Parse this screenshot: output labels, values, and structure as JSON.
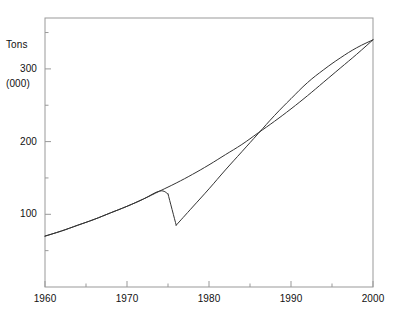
{
  "chart_data": {
    "type": "line",
    "title": "",
    "subtitle": "",
    "ylabel_line1": "Tons",
    "ylabel_line2": "(000)",
    "ylabel": "Tons (000)",
    "xlabel": "",
    "xlim": [
      1960,
      2000
    ],
    "ylim": [
      0,
      370
    ],
    "grid": false,
    "legend": "none",
    "annotations": [],
    "x_major_ticks": [
      1960,
      1970,
      1980,
      1990,
      2000
    ],
    "x_major_tick_labels": [
      "1960",
      "1970",
      "1980",
      "1990",
      "2000"
    ],
    "x_minor_ticks": [
      1965,
      1975,
      1985,
      1995
    ],
    "y_major_ticks": [
      100,
      200,
      300
    ],
    "y_major_tick_labels": [
      "100",
      "200",
      "300"
    ],
    "y_minor_ticks": [
      50,
      150,
      250,
      350
    ],
    "line_color": "#333333",
    "axis_color": "#999999",
    "series": [
      {
        "name": "trend",
        "x": [
          1960,
          1962,
          1964,
          1966,
          1968,
          1970,
          1972,
          1974,
          1976,
          1978,
          1980,
          1982,
          1984,
          1986,
          1988,
          1990,
          1992,
          1994,
          1996,
          1998,
          2000
        ],
        "values": [
          70,
          77,
          85,
          93,
          102,
          111,
          121,
          132,
          143,
          155,
          168,
          182,
          196,
          212,
          228,
          245,
          263,
          282,
          301,
          320,
          340
        ]
      },
      {
        "name": "disrupted",
        "x": [
          1960,
          1962,
          1964,
          1966,
          1968,
          1970,
          1972,
          1974,
          1975,
          1976,
          1978,
          1980,
          1982,
          1984,
          1986,
          1988,
          1990,
          1992,
          1994,
          1996,
          1998,
          2000
        ],
        "values": [
          70,
          77,
          85,
          93,
          102,
          111,
          121,
          132,
          128,
          85,
          110,
          135,
          161,
          186,
          211,
          236,
          259,
          281,
          299,
          315,
          329,
          340
        ]
      }
    ]
  },
  "plot": {
    "frame": {
      "left": 45,
      "top": 18,
      "right": 373,
      "bottom": 287
    }
  }
}
